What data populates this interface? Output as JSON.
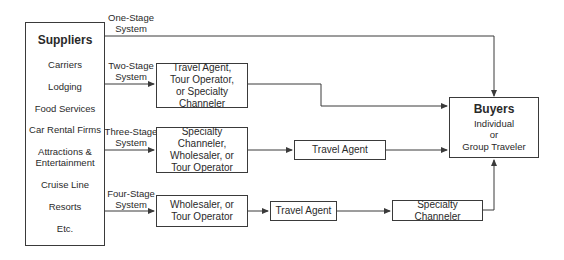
{
  "suppliers": {
    "title": "Suppliers",
    "items": [
      "Carriers",
      "Lodging",
      "Food Services",
      "Car Rental Firms",
      "Attractions &\nEntertainment",
      "Cruise Line",
      "Resorts",
      "Etc."
    ]
  },
  "buyers": {
    "title": "Buyers",
    "lines": [
      "Individual",
      "or",
      "Group Traveler"
    ]
  },
  "systems": [
    {
      "label_line1": "One-Stage",
      "label_line2": "System",
      "boxes": []
    },
    {
      "label_line1": "Two-Stage",
      "label_line2": "System",
      "boxes": [
        "Travel Agent, Tour Operator, or Specialty Channeler"
      ]
    },
    {
      "label_line1": "Three-Stage",
      "label_line2": "System",
      "boxes": [
        "Specialty Channeler, Wholesaler, or Tour Operator",
        "Travel Agent"
      ]
    },
    {
      "label_line1": "Four-Stage",
      "label_line2": "System",
      "boxes": [
        "Wholesaler, or Tour Operator",
        "Travel Agent",
        "Specialty Channeler"
      ]
    }
  ],
  "colors": {
    "line": "#3a3a3a",
    "background": "#ffffff"
  }
}
